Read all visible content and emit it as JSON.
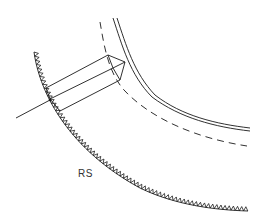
{
  "diagram": {
    "type": "technical-line-drawing",
    "labels": {
      "region": "RS"
    },
    "elements": [
      {
        "name": "serrated-outer-arc",
        "style": "solid-with-sawtooth"
      },
      {
        "name": "double-inner-arc",
        "style": "double-solid"
      },
      {
        "name": "dashed-arc",
        "style": "dashed"
      },
      {
        "name": "prism-bundle",
        "style": "three-parallel-lines"
      },
      {
        "name": "incident-ray",
        "style": "solid"
      }
    ],
    "colors": {
      "line": "#1a1a1a",
      "background": "#ffffff",
      "text": "#333333"
    }
  }
}
